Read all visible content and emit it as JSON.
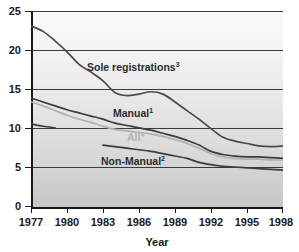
{
  "chart_data": {
    "type": "line",
    "title": "",
    "subtitle": "",
    "xlabel": "Year",
    "ylabel": "",
    "xlim": [
      1977,
      1998
    ],
    "ylim": [
      0,
      25
    ],
    "grid": true,
    "legend_position": "inline-labels",
    "x_ticks": [
      "1977",
      "1980",
      "1983",
      "1986",
      "1989",
      "1992",
      "1995",
      "1998"
    ],
    "x_tick_values": [
      1977,
      1980,
      1983,
      1986,
      1989,
      1992,
      1995,
      1998
    ],
    "y_ticks": [
      "0",
      "5",
      "10",
      "15",
      "20",
      "25"
    ],
    "y_tick_values": [
      0,
      5,
      10,
      15,
      20,
      25
    ],
    "x": [
      1977,
      1978,
      1979,
      1980,
      1981,
      1982,
      1983,
      1984,
      1985,
      1986,
      1987,
      1988,
      1989,
      1990,
      1991,
      1992,
      1993,
      1994,
      1995,
      1996,
      1997,
      1998
    ],
    "series": [
      {
        "name": "Sole registrations",
        "label": "Sole registrations",
        "footnote": "3",
        "color": "#4a4a4a",
        "x": [
          1977,
          1978,
          1979,
          1980,
          1981,
          1982,
          1983,
          1984,
          1985,
          1986,
          1987,
          1988,
          1989,
          1990,
          1991,
          1992,
          1993,
          1994,
          1995,
          1996,
          1997,
          1998
        ],
        "values": [
          23.1,
          22.4,
          21.2,
          19.8,
          18.2,
          17.2,
          16.1,
          14.6,
          14.2,
          14.4,
          14.7,
          14.4,
          13.4,
          12.3,
          11.2,
          10.0,
          8.9,
          8.4,
          8.1,
          7.8,
          7.7,
          7.8
        ]
      },
      {
        "name": "Manual",
        "label": "Manual",
        "footnote": "1",
        "color": "#3c3c3c",
        "x": [
          1977,
          1978,
          1979,
          1980,
          1981,
          1982,
          1983,
          1984,
          1985,
          1986,
          1987,
          1988,
          1989,
          1990,
          1991,
          1992,
          1993,
          1994,
          1995,
          1996,
          1997,
          1998
        ],
        "values": [
          13.9,
          13.4,
          12.9,
          12.4,
          12.0,
          11.6,
          11.2,
          10.7,
          10.4,
          10.1,
          9.8,
          9.4,
          9.0,
          8.5,
          7.9,
          7.1,
          6.7,
          6.5,
          6.4,
          6.4,
          6.3,
          6.2
        ]
      },
      {
        "name": "All",
        "label": "All",
        "footnote": "4",
        "color": "#b0b0b0",
        "x": [
          1977,
          1978,
          1979,
          1980,
          1981,
          1982,
          1983,
          1984,
          1985,
          1986,
          1987,
          1988,
          1989,
          1990,
          1991,
          1992,
          1993,
          1994,
          1995,
          1996,
          1997,
          1998
        ],
        "values": [
          13.4,
          12.9,
          12.3,
          11.7,
          11.2,
          10.8,
          10.3,
          9.9,
          9.7,
          9.5,
          9.3,
          9.0,
          8.6,
          8.1,
          7.5,
          6.8,
          6.4,
          6.2,
          6.1,
          6.1,
          6.0,
          6.0
        ]
      },
      {
        "name": "Non-Manual early",
        "label": "",
        "footnote": "",
        "color": "#3c3c3c",
        "x": [
          1977,
          1978,
          1979
        ],
        "values": [
          10.6,
          10.3,
          10.1
        ]
      },
      {
        "name": "Non-Manual",
        "label": "Non-Manual",
        "footnote": "2",
        "color": "#3c3c3c",
        "x": [
          1983,
          1984,
          1985,
          1986,
          1987,
          1988,
          1989,
          1990,
          1991,
          1992,
          1993,
          1994,
          1995,
          1996,
          1997,
          1998
        ],
        "values": [
          7.9,
          7.7,
          7.5,
          7.3,
          7.1,
          6.8,
          6.5,
          6.2,
          5.7,
          5.4,
          5.2,
          5.1,
          5.0,
          4.9,
          4.8,
          4.7
        ]
      }
    ],
    "inline_labels": [
      {
        "name": "sole-registrations",
        "text": "Sole registrations",
        "sup": "3",
        "x": 87,
        "y": 71,
        "style": "dark"
      },
      {
        "name": "manual",
        "text": "Manual",
        "sup": "1",
        "x": 113,
        "y": 117,
        "style": "dark"
      },
      {
        "name": "all",
        "text": "All",
        "sup": "4",
        "x": 127,
        "y": 141,
        "style": "light"
      },
      {
        "name": "non-manual",
        "text": "Non-Manual",
        "sup": "2",
        "x": 101,
        "y": 165,
        "style": "dark"
      }
    ]
  },
  "colors": {
    "grid": "#3a3a3a",
    "axis": "#1a1a1a",
    "plot_bg_top": "#f7f7f7",
    "plot_bg_bottom": "#c9c9c9",
    "label_dark": "#2b2b2b",
    "label_light": "#b4b4b4"
  }
}
